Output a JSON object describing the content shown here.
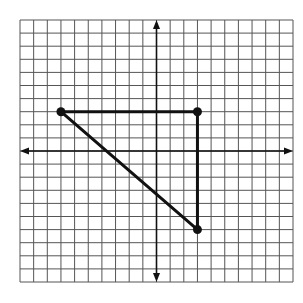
{
  "chart_data": {
    "type": "coordinate_grid",
    "title": "",
    "grid": {
      "columns": 20,
      "rows": 20,
      "x_range": [
        -10,
        10
      ],
      "y_range": [
        -10,
        10
      ],
      "pixel_bounds": {
        "left": 20,
        "top": 20,
        "right": 293,
        "bottom": 282
      },
      "grid_color": "#555555",
      "grid_on": true
    },
    "axes": {
      "x_axis": {
        "arrows": true,
        "labels": false
      },
      "y_axis": {
        "arrows": true,
        "labels": false
      },
      "color": "#111111"
    },
    "shapes": [
      {
        "type": "triangle",
        "name": "right-triangle",
        "stroke": "#111111",
        "vertices": [
          {
            "x": -7,
            "y": 3
          },
          {
            "x": 3,
            "y": 3
          },
          {
            "x": 3,
            "y": -6
          }
        ]
      }
    ]
  }
}
